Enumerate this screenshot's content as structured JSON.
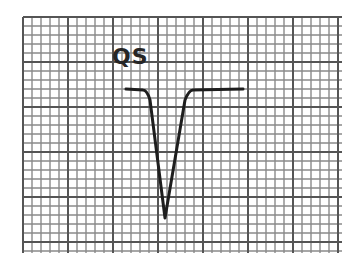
{
  "diagram": {
    "label": "QS",
    "grid": {
      "left": 23,
      "top": 17,
      "right": 342,
      "bottom": 253,
      "small_cell": 9,
      "major_every": 5,
      "minor_color": "#8a8a8a",
      "major_color": "#555555"
    },
    "waveform": {
      "color": "#1e1e1e",
      "stroke_width": 3,
      "points": [
        {
          "x": 126,
          "y": 89
        },
        {
          "x": 143,
          "y": 90
        },
        {
          "x": 150,
          "y": 100
        },
        {
          "x": 165,
          "y": 218
        },
        {
          "x": 185,
          "y": 100
        },
        {
          "x": 193,
          "y": 90
        },
        {
          "x": 243,
          "y": 89
        }
      ]
    }
  }
}
